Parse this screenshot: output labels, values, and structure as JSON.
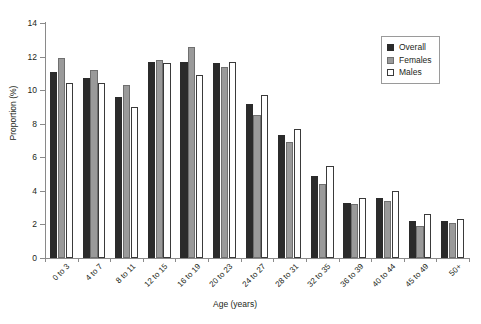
{
  "chart_data": {
    "type": "bar",
    "title": "",
    "xlabel": "Age (years)",
    "ylabel": "Proportion (%)",
    "ylim": [
      0,
      14
    ],
    "yticks": [
      0,
      2,
      4,
      6,
      8,
      10,
      12,
      14
    ],
    "grid": false,
    "legend_position": "top-right",
    "categories": [
      "0 to 3",
      "4 to 7",
      "8 to 11",
      "12 to 15",
      "16 to 19",
      "20 to 23",
      "24 to 27",
      "28 to 31",
      "32 to 35",
      "36 to 39",
      "40 to 44",
      "45 to 49",
      "50+"
    ],
    "series": [
      {
        "name": "Overall",
        "color": "#2b2b2b",
        "values": [
          11.1,
          10.7,
          9.6,
          11.7,
          11.7,
          11.6,
          9.2,
          7.3,
          4.9,
          3.3,
          3.6,
          2.2,
          2.2
        ]
      },
      {
        "name": "Females",
        "color": "#9a9a9a",
        "values": [
          11.9,
          11.2,
          10.3,
          11.8,
          12.6,
          11.4,
          8.5,
          6.9,
          4.4,
          3.2,
          3.4,
          1.9,
          2.1
        ]
      },
      {
        "name": "Males",
        "color": "#ffffff",
        "values": [
          10.4,
          10.4,
          9.0,
          11.6,
          10.9,
          11.7,
          9.7,
          7.7,
          5.5,
          3.6,
          4.0,
          2.6,
          2.3
        ]
      }
    ]
  },
  "legend": {
    "items": [
      {
        "label": "Overall",
        "key": "overall"
      },
      {
        "label": "Females",
        "key": "females"
      },
      {
        "label": "Males",
        "key": "males"
      }
    ]
  }
}
